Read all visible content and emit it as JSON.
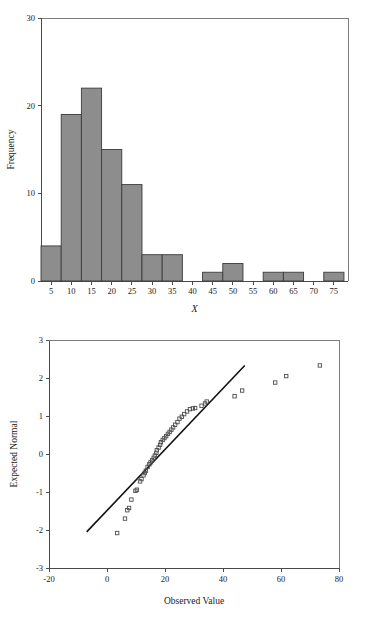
{
  "figure": {
    "title": "",
    "panels": [
      "histogram-of-x",
      "normal-q-q-plot"
    ]
  },
  "chart_data": [
    {
      "id": "histogram",
      "type": "bar",
      "title": "",
      "subtitle": "",
      "xlabel": "X",
      "ylabel": "Frequency",
      "xlim": [
        2.5,
        78.5
      ],
      "ylim": [
        0,
        30
      ],
      "grid": false,
      "legend": null,
      "bin_width": 5,
      "bar_color": "#8d8d8d",
      "bar_edge_color": "#3c3c3c",
      "xticks": [
        5,
        10,
        15,
        20,
        25,
        30,
        35,
        40,
        45,
        50,
        55,
        60,
        65,
        70,
        75
      ],
      "xtick_labels": [
        "5",
        "10",
        "15",
        "20",
        "25",
        "30",
        "35",
        "40",
        "45",
        "50",
        "55",
        "60",
        "65",
        "70",
        "75"
      ],
      "yticks": [
        0,
        10,
        20,
        30
      ],
      "ytick_labels": [
        "0",
        "10",
        "20",
        "30"
      ],
      "categories": [
        5,
        10,
        15,
        20,
        25,
        30,
        35,
        40,
        45,
        50,
        55,
        60,
        65,
        70,
        75
      ],
      "values": [
        4,
        19,
        22,
        15,
        11,
        3,
        3,
        0,
        1,
        2,
        0,
        1,
        1,
        0,
        1
      ],
      "bins": [
        {
          "center": 5,
          "left": 2.5,
          "right": 7.5,
          "count": 4
        },
        {
          "center": 10,
          "left": 7.5,
          "right": 12.5,
          "count": 19
        },
        {
          "center": 15,
          "left": 12.5,
          "right": 17.5,
          "count": 22
        },
        {
          "center": 20,
          "left": 17.5,
          "right": 22.5,
          "count": 15
        },
        {
          "center": 25,
          "left": 22.5,
          "right": 27.5,
          "count": 11
        },
        {
          "center": 30,
          "left": 27.5,
          "right": 32.5,
          "count": 3
        },
        {
          "center": 35,
          "left": 32.5,
          "right": 37.5,
          "count": 3
        },
        {
          "center": 40,
          "left": 37.5,
          "right": 42.5,
          "count": 0
        },
        {
          "center": 45,
          "left": 42.5,
          "right": 47.5,
          "count": 1
        },
        {
          "center": 50,
          "left": 47.5,
          "right": 52.5,
          "count": 2
        },
        {
          "center": 55,
          "left": 52.5,
          "right": 57.5,
          "count": 0
        },
        {
          "center": 60,
          "left": 57.5,
          "right": 62.5,
          "count": 1
        },
        {
          "center": 65,
          "left": 62.5,
          "right": 67.5,
          "count": 1
        },
        {
          "center": 70,
          "left": 67.5,
          "right": 72.5,
          "count": 0
        },
        {
          "center": 75,
          "left": 72.5,
          "right": 77.5,
          "count": 1
        }
      ]
    },
    {
      "id": "qq-plot",
      "type": "scatter",
      "title": "",
      "subtitle": "",
      "xlabel": "Observed Value",
      "ylabel": "Expected Normal",
      "xlim": [
        -20,
        80
      ],
      "ylim": [
        -3,
        3
      ],
      "grid": false,
      "legend": null,
      "marker": "open-square",
      "marker_color": "#4d4d4d",
      "xticks": [
        -20,
        0,
        20,
        40,
        60,
        80
      ],
      "xtick_labels": [
        "-20",
        "0",
        "20",
        "40",
        "60",
        "80"
      ],
      "yticks": [
        -3,
        -2,
        -1,
        0,
        1,
        2,
        3
      ],
      "ytick_labels": [
        "-3",
        "-2",
        "-1",
        "0",
        "1",
        "2",
        "3"
      ],
      "reference_line": {
        "x0": -7.0,
        "y0": -2.05,
        "x1": 47.5,
        "y1": 2.33
      },
      "points": [
        {
          "x": 3.5,
          "y": -2.08
        },
        {
          "x": 6.2,
          "y": -1.7
        },
        {
          "x": 7.0,
          "y": -1.48
        },
        {
          "x": 7.6,
          "y": -1.42
        },
        {
          "x": 8.4,
          "y": -1.2
        },
        {
          "x": 9.8,
          "y": -0.97
        },
        {
          "x": 10.3,
          "y": -0.94
        },
        {
          "x": 11.4,
          "y": -0.72
        },
        {
          "x": 11.9,
          "y": -0.66
        },
        {
          "x": 12.6,
          "y": -0.56
        },
        {
          "x": 13.0,
          "y": -0.5
        },
        {
          "x": 13.4,
          "y": -0.44
        },
        {
          "x": 14.0,
          "y": -0.34
        },
        {
          "x": 14.6,
          "y": -0.27
        },
        {
          "x": 15.0,
          "y": -0.22
        },
        {
          "x": 15.6,
          "y": -0.16
        },
        {
          "x": 16.1,
          "y": -0.1
        },
        {
          "x": 16.5,
          "y": -0.04
        },
        {
          "x": 17.0,
          "y": 0.03
        },
        {
          "x": 17.2,
          "y": 0.1
        },
        {
          "x": 17.8,
          "y": 0.17
        },
        {
          "x": 18.3,
          "y": 0.24
        },
        {
          "x": 18.6,
          "y": 0.31
        },
        {
          "x": 19.2,
          "y": 0.37
        },
        {
          "x": 19.8,
          "y": 0.42
        },
        {
          "x": 20.4,
          "y": 0.47
        },
        {
          "x": 21.0,
          "y": 0.53
        },
        {
          "x": 21.6,
          "y": 0.58
        },
        {
          "x": 22.2,
          "y": 0.64
        },
        {
          "x": 22.8,
          "y": 0.7
        },
        {
          "x": 23.5,
          "y": 0.77
        },
        {
          "x": 24.3,
          "y": 0.84
        },
        {
          "x": 25.0,
          "y": 0.93
        },
        {
          "x": 25.8,
          "y": 0.98
        },
        {
          "x": 26.6,
          "y": 1.05
        },
        {
          "x": 27.6,
          "y": 1.12
        },
        {
          "x": 28.6,
          "y": 1.18
        },
        {
          "x": 29.6,
          "y": 1.2
        },
        {
          "x": 30.4,
          "y": 1.21
        },
        {
          "x": 32.6,
          "y": 1.27
        },
        {
          "x": 33.8,
          "y": 1.33
        },
        {
          "x": 34.4,
          "y": 1.38
        },
        {
          "x": 44.0,
          "y": 1.52
        },
        {
          "x": 46.6,
          "y": 1.67
        },
        {
          "x": 58.0,
          "y": 1.88
        },
        {
          "x": 61.8,
          "y": 2.05
        },
        {
          "x": 73.4,
          "y": 2.33
        }
      ]
    }
  ]
}
